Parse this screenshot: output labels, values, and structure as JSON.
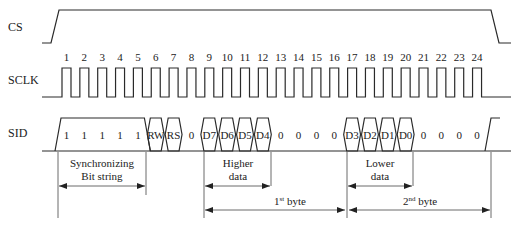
{
  "signals": {
    "cs": "CS",
    "sclk": "SCLK",
    "sid": "SID"
  },
  "clock_numbers": [
    "1",
    "2",
    "3",
    "4",
    "5",
    "6",
    "7",
    "8",
    "9",
    "10",
    "11",
    "12",
    "13",
    "14",
    "15",
    "16",
    "17",
    "18",
    "19",
    "20",
    "21",
    "22",
    "23",
    "24"
  ],
  "sid_bits": [
    {
      "clock": 1,
      "label": "1",
      "shape": "sync"
    },
    {
      "clock": 2,
      "label": "1",
      "shape": "sync"
    },
    {
      "clock": 3,
      "label": "1",
      "shape": "sync"
    },
    {
      "clock": 4,
      "label": "1",
      "shape": "sync"
    },
    {
      "clock": 5,
      "label": "1",
      "shape": "sync"
    },
    {
      "clock": 6,
      "label": "RW",
      "shape": "hex"
    },
    {
      "clock": 7,
      "label": "RS",
      "shape": "hex"
    },
    {
      "clock": 8,
      "label": "0",
      "shape": "low"
    },
    {
      "clock": 9,
      "label": "D7",
      "shape": "hex"
    },
    {
      "clock": 10,
      "label": "D6",
      "shape": "hex"
    },
    {
      "clock": 11,
      "label": "D5",
      "shape": "hex"
    },
    {
      "clock": 12,
      "label": "D4",
      "shape": "hex"
    },
    {
      "clock": 13,
      "label": "0",
      "shape": "low"
    },
    {
      "clock": 14,
      "label": "0",
      "shape": "low"
    },
    {
      "clock": 15,
      "label": "0",
      "shape": "low"
    },
    {
      "clock": 16,
      "label": "0",
      "shape": "low"
    },
    {
      "clock": 17,
      "label": "D3",
      "shape": "hex"
    },
    {
      "clock": 18,
      "label": "D2",
      "shape": "hex"
    },
    {
      "clock": 19,
      "label": "D1",
      "shape": "hex"
    },
    {
      "clock": 20,
      "label": "D0",
      "shape": "hex"
    },
    {
      "clock": 21,
      "label": "0",
      "shape": "low"
    },
    {
      "clock": 22,
      "label": "0",
      "shape": "low"
    },
    {
      "clock": 23,
      "label": "0",
      "shape": "low"
    },
    {
      "clock": 24,
      "label": "0",
      "shape": "low"
    }
  ],
  "annotations": {
    "sync_line1": "Synchronizing",
    "sync_line2": "Bit string",
    "higher_line1": "Higher",
    "higher_line2": "data",
    "lower_line1": "Lower",
    "lower_line2": "data",
    "first_byte": "1",
    "first_byte_sup": "st",
    "first_byte_word": " byte",
    "second_byte": "2",
    "second_byte_sup": "nd",
    "second_byte_word": " byte"
  },
  "colors": {
    "line": "#2a2a2a",
    "text": "#222222",
    "background": "#ffffff"
  }
}
